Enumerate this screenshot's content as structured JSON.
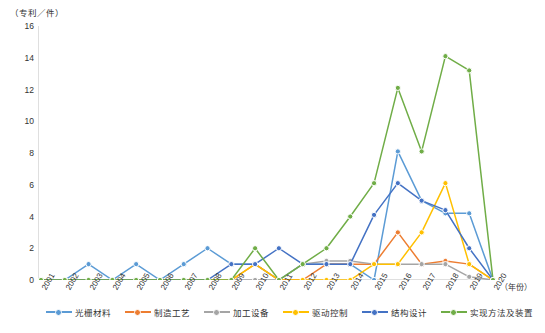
{
  "chart_data": {
    "type": "line",
    "title": "",
    "subtitle": "",
    "ylabel": "（专利／件）",
    "xlabel": "（年份）",
    "ylim": [
      0,
      16
    ],
    "yticks": [
      0,
      2,
      4,
      6,
      8,
      10,
      12,
      14,
      16
    ],
    "grid": false,
    "legend_position": "bottom",
    "categories": [
      "2001",
      "2002",
      "2003",
      "2004",
      "2005",
      "2006",
      "2007",
      "2008",
      "2009",
      "2010",
      "2011",
      "2012",
      "2013",
      "2014",
      "2015",
      "2016",
      "2017",
      "2018",
      "2019",
      "2020"
    ],
    "series": [
      {
        "name": "光栅材料",
        "color": "#5b9bd5",
        "values": [
          0,
          0,
          1,
          0,
          1,
          0,
          1,
          2,
          1,
          1,
          0,
          1,
          1,
          1,
          0,
          8.1,
          5,
          4.2,
          4.2,
          0
        ]
      },
      {
        "name": "制造工艺",
        "color": "#ed7d31",
        "values": [
          0,
          0,
          0,
          0,
          0,
          0,
          0,
          0,
          0,
          1,
          0,
          0,
          1,
          1,
          1,
          3,
          1,
          1.2,
          1,
          0
        ]
      },
      {
        "name": "加工设备",
        "color": "#a5a5a5",
        "values": [
          0,
          0,
          0,
          0,
          0,
          0,
          0,
          0,
          0,
          0,
          0,
          1,
          1.2,
          1.2,
          1,
          1,
          1,
          1,
          0.2,
          0
        ]
      },
      {
        "name": "驱动控制",
        "color": "#ffc000",
        "values": [
          0,
          0,
          0,
          0,
          0,
          0,
          0,
          0,
          0,
          1,
          0,
          0,
          0,
          0,
          1,
          1,
          3,
          6.1,
          1,
          0
        ]
      },
      {
        "name": "结构设计",
        "color": "#4472c4",
        "values": [
          0,
          0,
          0,
          0,
          0,
          0,
          0,
          0,
          1,
          1,
          2,
          1,
          1,
          1,
          4.1,
          6.1,
          5,
          4.4,
          2,
          0
        ]
      },
      {
        "name": "实现方法及装置",
        "color": "#70ad47",
        "values": [
          0,
          0,
          0,
          0,
          0,
          0,
          0,
          0,
          0,
          2,
          0,
          1,
          2,
          4,
          6.1,
          12.1,
          8.1,
          14.1,
          13.2,
          0
        ]
      }
    ]
  }
}
